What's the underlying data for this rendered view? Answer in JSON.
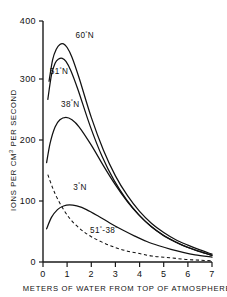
{
  "chart_data": {
    "type": "line",
    "title": "",
    "xlabel": "METERS OF WATER FROM TOP OF ATMOSPHERE",
    "ylabel": "IONS PER CM3 PER SECOND",
    "ylabel_parts": {
      "pre": "IONS PER CM",
      "sup": "3",
      "post": " PER SECOND"
    },
    "xlim": [
      0,
      7
    ],
    "ylim": [
      0,
      400
    ],
    "xticks": [
      0,
      1,
      2,
      3,
      4,
      5,
      6,
      7
    ],
    "xtick_labels": [
      "0",
      "1",
      "2",
      "3",
      "4",
      "5",
      "6",
      "7"
    ],
    "yticks": [
      0,
      100,
      200,
      300,
      400
    ],
    "ytick_labels": [
      "0",
      "100",
      "200",
      "300",
      "400"
    ],
    "grid": false,
    "legend_position": "inline-annotations",
    "series": [
      {
        "name": "60 N",
        "label": "60°N",
        "label_value": "60",
        "label_suffix": "N",
        "style": "solid",
        "peak_x": 0.85,
        "peak_y": 362,
        "x": [
          0.25,
          0.4,
          0.55,
          0.7,
          0.85,
          1.0,
          1.2,
          1.5,
          2.0,
          2.5,
          3.0,
          3.5,
          4.0,
          4.5,
          5.0,
          5.5,
          6.0,
          6.5,
          7.0
        ],
        "y": [
          300,
          336,
          353,
          361,
          362,
          356,
          340,
          305,
          240,
          186,
          143,
          110,
          84,
          64,
          49,
          37,
          28,
          20,
          13
        ]
      },
      {
        "name": "51 N",
        "label": "51°N",
        "label_value": "51",
        "label_suffix": "N",
        "style": "solid",
        "peak_x": 0.8,
        "peak_y": 338,
        "x": [
          0.2,
          0.35,
          0.5,
          0.65,
          0.8,
          0.95,
          1.15,
          1.45,
          1.95,
          2.45,
          2.95,
          3.45,
          3.95,
          4.45,
          4.95,
          5.45,
          5.95,
          6.45,
          7.0
        ],
        "y": [
          270,
          310,
          330,
          337,
          338,
          333,
          318,
          286,
          226,
          175,
          135,
          104,
          79,
          60,
          45,
          34,
          25,
          18,
          11
        ]
      },
      {
        "name": "38 N",
        "label": "38°N",
        "label_value": "38",
        "label_suffix": "N",
        "style": "solid",
        "peak_x": 0.95,
        "peak_y": 240,
        "x": [
          0.15,
          0.3,
          0.5,
          0.7,
          0.95,
          1.2,
          1.5,
          2.0,
          2.5,
          3.0,
          3.5,
          4.0,
          4.5,
          5.0,
          5.5,
          6.0,
          6.5,
          7.0
        ],
        "y": [
          165,
          198,
          224,
          236,
          240,
          236,
          224,
          194,
          160,
          128,
          100,
          77,
          58,
          44,
          33,
          24,
          17,
          11
        ]
      },
      {
        "name": "3 N",
        "label": "3°N",
        "label_value": "3",
        "label_suffix": "N",
        "style": "solid",
        "peak_x": 1.1,
        "peak_y": 95,
        "x": [
          0.15,
          0.35,
          0.6,
          0.85,
          1.1,
          1.4,
          1.8,
          2.3,
          2.8,
          3.3,
          3.8,
          4.3,
          4.8,
          5.3,
          5.8,
          6.3,
          7.0
        ],
        "y": [
          55,
          74,
          87,
          93,
          95,
          93,
          87,
          76,
          64,
          53,
          43,
          34,
          27,
          21,
          16,
          12,
          8
        ]
      },
      {
        "name": "51-38 difference",
        "label": "51°-38°",
        "label_value": "51",
        "label_suffix": "38",
        "style": "dashed",
        "x": [
          0.2,
          0.4,
          0.6,
          0.9,
          1.2,
          1.6,
          2.0,
          2.5,
          3.0,
          3.5,
          4.0,
          4.5,
          5.0,
          5.5,
          6.0,
          6.5,
          7.0
        ],
        "y": [
          145,
          123,
          105,
          84,
          68,
          53,
          42,
          32,
          24,
          18,
          14,
          10,
          8,
          6,
          4,
          3,
          2
        ]
      }
    ],
    "annotations": [
      {
        "text": "60°N",
        "x": 1.35,
        "y": 372
      },
      {
        "text": "51°N",
        "x": 0.28,
        "y": 312
      },
      {
        "text": "38°N",
        "x": 0.75,
        "y": 258
      },
      {
        "text": "3°N",
        "x": 1.25,
        "y": 120
      },
      {
        "text": "51°-38°",
        "x": 1.95,
        "y": 48
      }
    ],
    "colors": {
      "ink": "#111111",
      "background": "#ffffff"
    }
  }
}
